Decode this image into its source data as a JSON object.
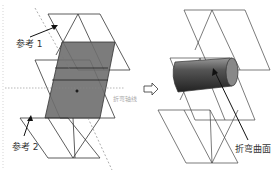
{
  "left_figure": {
    "ref1_label": "参考 1",
    "ref2_label": "参考 2",
    "axis_label": "折弯轴线"
  },
  "arrow": {
    "icon": "right-arrow-icon"
  },
  "right_figure": {
    "surface_label": "折弯曲面"
  },
  "colors": {
    "shaded_plane": "#6e6e6e",
    "lines": "#333333",
    "cylinder": "#555555"
  }
}
